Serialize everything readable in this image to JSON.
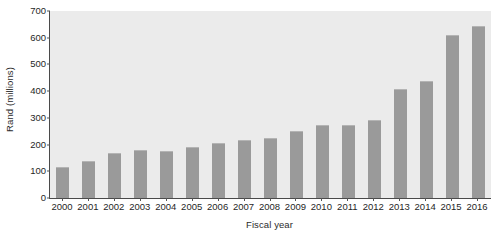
{
  "chart_data": {
    "type": "bar",
    "title": "",
    "subtitle": "",
    "xlabel": "Fiscal year",
    "ylabel": "Rand (millions)",
    "categories": [
      "2000",
      "2001",
      "2002",
      "2003",
      "2004",
      "2005",
      "2006",
      "2007",
      "2008",
      "2009",
      "2010",
      "2011",
      "2012",
      "2013",
      "2014",
      "2015",
      "2016"
    ],
    "values": [
      117,
      140,
      167,
      180,
      177,
      190,
      207,
      218,
      225,
      250,
      272,
      272,
      292,
      408,
      438,
      612,
      645
    ],
    "series": [
      {
        "name": "Rand (millions)",
        "values": [
          117,
          140,
          167,
          180,
          177,
          190,
          207,
          218,
          225,
          250,
          272,
          272,
          292,
          408,
          438,
          612,
          645
        ]
      }
    ],
    "ylim": [
      0,
      700
    ],
    "yticks": [
      0,
      100,
      200,
      300,
      400,
      500,
      600,
      700
    ],
    "ytick_labels": [
      "0",
      "100",
      "200",
      "300",
      "400",
      "500",
      "600",
      "700"
    ],
    "grid": false,
    "legend": false,
    "legend_position": "none",
    "annotations": [],
    "bar_color": "#9a9a9a",
    "plot_background": "#ebebeb",
    "axis_color": "#4a4a4a",
    "figure_background": "#ffffff"
  }
}
